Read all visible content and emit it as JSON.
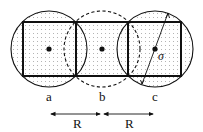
{
  "diagram": {
    "colors": {
      "stroke": "#111111",
      "fill": "#ffffff",
      "dots": "#555555"
    },
    "cells": [
      {
        "label": "a",
        "cx": 49,
        "cy": 49,
        "circle_style": "solid"
      },
      {
        "label": "b",
        "cx": 102,
        "cy": 49,
        "circle_style": "dashed"
      },
      {
        "label": "c",
        "cx": 155,
        "cy": 49,
        "circle_style": "solid"
      }
    ],
    "square_half": 27,
    "circle_radius": 38,
    "sigma_label": "σ",
    "distances": [
      {
        "label": "R",
        "from": "a",
        "to": "b"
      },
      {
        "label": "R",
        "from": "b",
        "to": "c"
      }
    ]
  }
}
